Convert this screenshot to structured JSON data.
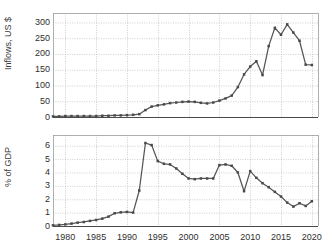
{
  "figure": {
    "background": "#ffffff",
    "line_color": "#555555",
    "marker_color": "#4a4a4a",
    "grid_color": "#b9b9b9",
    "axis_color": "#4a4a4a",
    "text_color": "#2f2f2f"
  },
  "chart_data": [
    {
      "type": "line",
      "panel": "top",
      "title": "",
      "xlabel": "",
      "ylabel": "Inflows, US $",
      "xlim": [
        1978,
        2021
      ],
      "ylim": [
        0,
        330
      ],
      "grid": true,
      "legend": "none",
      "xticks": [
        1980,
        1985,
        1990,
        1995,
        2000,
        2005,
        2010,
        2015,
        2020
      ],
      "yticks": [
        0,
        50,
        100,
        150,
        200,
        250,
        300
      ],
      "x": [
        1978,
        1979,
        1980,
        1981,
        1982,
        1983,
        1984,
        1985,
        1986,
        1987,
        1988,
        1989,
        1990,
        1991,
        1992,
        1993,
        1994,
        1995,
        1996,
        1997,
        1998,
        1999,
        2000,
        2001,
        2002,
        2003,
        2004,
        2005,
        2006,
        2007,
        2008,
        2009,
        2010,
        2011,
        2012,
        2013,
        2014,
        2015,
        2016,
        2017,
        2018,
        2019,
        2020
      ],
      "values": [
        2,
        2,
        3,
        3,
        3,
        3,
        3,
        3,
        4,
        4,
        5,
        5,
        6,
        7,
        9,
        22,
        33,
        37,
        40,
        44,
        46,
        48,
        49,
        48,
        45,
        43,
        46,
        52,
        59,
        68,
        95,
        135,
        160,
        177,
        133,
        225,
        283,
        261,
        294,
        268,
        242,
        166,
        165,
        196,
        244,
        189,
        256
      ]
    },
    {
      "type": "line",
      "panel": "bottom",
      "title": "",
      "xlabel": "",
      "ylabel": "% of GDP",
      "xlim": [
        1978,
        2021
      ],
      "ylim": [
        0,
        6.8
      ],
      "grid": true,
      "legend": "none",
      "xticks": [
        1980,
        1985,
        1990,
        1995,
        2000,
        2005,
        2010,
        2015,
        2020
      ],
      "yticks": [
        0,
        1,
        2,
        3,
        4,
        5,
        6
      ],
      "x": [
        1978,
        1979,
        1980,
        1981,
        1982,
        1983,
        1984,
        1985,
        1986,
        1987,
        1988,
        1989,
        1990,
        1991,
        1992,
        1993,
        1994,
        1995,
        1996,
        1997,
        1998,
        1999,
        2000,
        2001,
        2002,
        2003,
        2004,
        2005,
        2006,
        2007,
        2008,
        2009,
        2010,
        2011,
        2012,
        2013,
        2014,
        2015,
        2016,
        2017,
        2018,
        2019,
        2020
      ],
      "values": [
        0.05,
        0.08,
        0.12,
        0.18,
        0.25,
        0.3,
        0.38,
        0.45,
        0.55,
        0.7,
        0.95,
        1.02,
        1.05,
        1.0,
        2.65,
        6.2,
        6.05,
        4.85,
        4.65,
        4.6,
        4.3,
        3.9,
        3.55,
        3.5,
        3.55,
        3.55,
        3.55,
        4.55,
        4.6,
        4.5,
        4.0,
        2.6,
        4.1,
        3.6,
        3.2,
        2.9,
        2.55,
        2.2,
        1.75,
        1.45,
        1.7,
        1.5,
        1.85
      ]
    }
  ]
}
